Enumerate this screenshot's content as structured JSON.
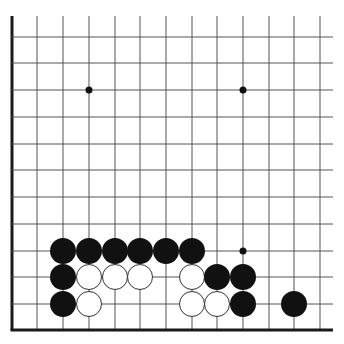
{
  "board": {
    "type": "go-diagram-partial",
    "colors": {
      "background": "#ffffff",
      "line": "#555555",
      "edge": "#1a1a1a",
      "black": "#111111",
      "white": "#ffffff",
      "white_outline": "#333333"
    },
    "columns_x": [
      12,
      37,
      63,
      89,
      115,
      140,
      166,
      192,
      217,
      243,
      269,
      294,
      320
    ],
    "rows_y": [
      37,
      63,
      90,
      117,
      144,
      170,
      197,
      224,
      251,
      277,
      304,
      330
    ],
    "grid_top": 16,
    "grid_right": 333,
    "left_edge_x": 12,
    "bottom_edge_y": 330,
    "stone_radius": 13,
    "star_points": [
      {
        "x": 89,
        "y": 90
      },
      {
        "x": 243,
        "y": 90
      },
      {
        "x": 243,
        "y": 251
      }
    ],
    "stones": [
      {
        "color": "black",
        "x": 63,
        "y": 251
      },
      {
        "color": "black",
        "x": 89,
        "y": 251
      },
      {
        "color": "black",
        "x": 115,
        "y": 251
      },
      {
        "color": "black",
        "x": 140,
        "y": 251
      },
      {
        "color": "black",
        "x": 166,
        "y": 251
      },
      {
        "color": "black",
        "x": 192,
        "y": 251
      },
      {
        "color": "black",
        "x": 63,
        "y": 277
      },
      {
        "color": "white",
        "x": 89,
        "y": 277
      },
      {
        "color": "white",
        "x": 115,
        "y": 277
      },
      {
        "color": "white",
        "x": 140,
        "y": 277
      },
      {
        "color": "white",
        "x": 192,
        "y": 277
      },
      {
        "color": "black",
        "x": 217,
        "y": 277
      },
      {
        "color": "black",
        "x": 243,
        "y": 277
      },
      {
        "color": "black",
        "x": 63,
        "y": 304
      },
      {
        "color": "white",
        "x": 89,
        "y": 304
      },
      {
        "color": "white",
        "x": 192,
        "y": 304
      },
      {
        "color": "white",
        "x": 217,
        "y": 304
      },
      {
        "color": "black",
        "x": 243,
        "y": 304
      },
      {
        "color": "black",
        "x": 294,
        "y": 304
      }
    ]
  }
}
